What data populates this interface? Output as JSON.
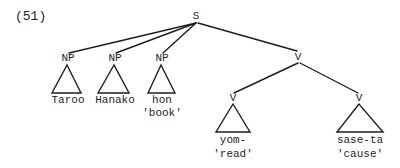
{
  "example_number": "(51)",
  "tree": {
    "root": {
      "label": "S"
    },
    "np_nodes": [
      {
        "label": "NP",
        "word": "Taroo",
        "gloss": ""
      },
      {
        "label": "NP",
        "word": "Hanako",
        "gloss": ""
      },
      {
        "label": "NP",
        "word": "hon",
        "gloss": "'book'"
      }
    ],
    "v_node": {
      "label": "V",
      "children": [
        {
          "label": "V",
          "word": "yom-",
          "gloss": "'read'"
        },
        {
          "label": "V",
          "word": "sase-ta",
          "gloss": "'cause'"
        }
      ]
    }
  },
  "colors": {
    "line": "#1e1e1e",
    "text": "#1e1e1e",
    "background": "#ffffff"
  }
}
